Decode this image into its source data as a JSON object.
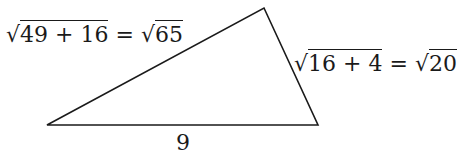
{
  "diagram": {
    "type": "triangle",
    "vertices": {
      "bottom_left": [
        47,
        125
      ],
      "bottom_right": [
        318,
        125
      ],
      "top": [
        264,
        8
      ]
    },
    "labels": {
      "left_side": {
        "lhs_radicand": "49 + 16",
        "equals": "=",
        "rhs_radicand": "65"
      },
      "right_side": {
        "lhs_radicand": "16 + 4",
        "equals": "=",
        "rhs_radicand": "20"
      },
      "base": "9"
    },
    "radical_symbol": "√",
    "stroke_color": "#1a1a1a"
  }
}
